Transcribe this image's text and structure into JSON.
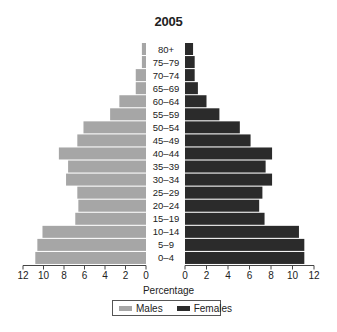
{
  "chart_data": {
    "type": "bar",
    "subtype": "population-pyramid",
    "title": "2005",
    "xlabel": "Percentage",
    "ylabel": "",
    "categories": [
      "80+",
      "75–79",
      "70–74",
      "65–69",
      "60–64",
      "55–59",
      "50–54",
      "45–49",
      "40–44",
      "35–39",
      "30–34",
      "25–29",
      "20–24",
      "15–19",
      "10–14",
      "5–9",
      "0–4"
    ],
    "series": [
      {
        "name": "Males",
        "color": "#a6a6a6",
        "side": "left",
        "values": [
          0.4,
          0.4,
          1.0,
          1.0,
          2.6,
          3.5,
          6.1,
          6.7,
          8.5,
          7.6,
          7.8,
          6.7,
          6.6,
          6.9,
          10.1,
          10.6,
          10.8
        ]
      },
      {
        "name": "Females",
        "color": "#2b2b2b",
        "side": "right",
        "values": [
          0.75,
          0.9,
          0.9,
          1.2,
          2.0,
          3.2,
          5.1,
          6.1,
          8.1,
          7.5,
          8.1,
          7.2,
          6.9,
          7.4,
          10.6,
          11.1,
          11.1
        ]
      }
    ],
    "xlim": [
      0,
      12
    ],
    "left_ticks": [
      "12",
      "10",
      "8",
      "6",
      "4",
      "2",
      "0"
    ],
    "right_ticks": [
      "0",
      "2",
      "4",
      "6",
      "8",
      "10",
      "12"
    ],
    "grid": false,
    "legend_position": "bottom-center"
  },
  "legend": {
    "males_label": "Males",
    "females_label": "Females"
  }
}
